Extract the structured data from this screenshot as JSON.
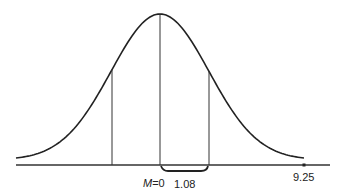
{
  "chart_data": {
    "type": "line",
    "title": "",
    "xlabel": "",
    "ylabel": "",
    "mean_label": "M",
    "mean_value": "0",
    "interval_label": "1.08",
    "marked_point_label": "9.25",
    "vertical_lines_x": [
      -1.08,
      0,
      1.08
    ],
    "x": [
      -3.5,
      -3,
      -2.5,
      -2,
      -1.5,
      -1.08,
      -0.5,
      0,
      0.5,
      1.08,
      1.5,
      2,
      2.5,
      3,
      3.5
    ],
    "grid": false,
    "legend": null
  },
  "labels": {
    "mean_var": "M",
    "mean_eq": "=0",
    "interval": "1.08",
    "point": "9.25"
  },
  "colors": {
    "line": "#222222",
    "background": "#ffffff"
  }
}
